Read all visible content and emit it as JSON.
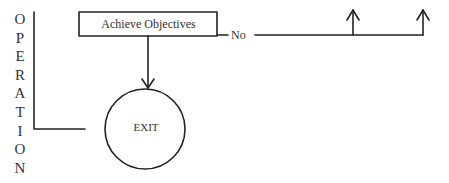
{
  "diagram": {
    "side_label": "OPERATION",
    "side_letters": [
      "O",
      "P",
      "E",
      "R",
      "A",
      "T",
      "I",
      "O",
      "N"
    ],
    "process_box": {
      "label": "Achieve Objectives"
    },
    "branch_label": "No",
    "terminal": {
      "label": "EXIT"
    },
    "line_color": "#222222"
  }
}
